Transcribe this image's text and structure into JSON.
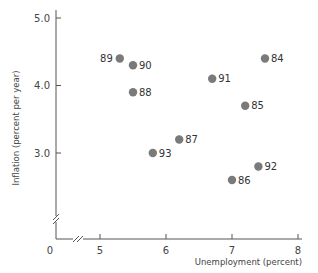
{
  "chart_data": {
    "type": "scatter",
    "title": "",
    "xlabel": "Unemployment (percent)",
    "ylabel": "Inflation (percent per year)",
    "xlim": [
      5,
      8
    ],
    "ylim": [
      2,
      5
    ],
    "x_ticks": [
      "0",
      "5",
      "6",
      "7",
      "8"
    ],
    "y_ticks": [
      "3.0",
      "4.0",
      "5.0"
    ],
    "axis_breaks": true,
    "grid": false,
    "legend": null,
    "marker_color": "#7a7a7a",
    "points": [
      {
        "label": "84",
        "x": 7.5,
        "y": 4.4
      },
      {
        "label": "85",
        "x": 7.2,
        "y": 3.7
      },
      {
        "label": "86",
        "x": 7.0,
        "y": 2.6
      },
      {
        "label": "87",
        "x": 6.2,
        "y": 3.2
      },
      {
        "label": "88",
        "x": 5.5,
        "y": 3.9
      },
      {
        "label": "89",
        "x": 5.3,
        "y": 4.4
      },
      {
        "label": "90",
        "x": 5.5,
        "y": 4.3
      },
      {
        "label": "91",
        "x": 6.7,
        "y": 4.1
      },
      {
        "label": "92",
        "x": 7.4,
        "y": 2.8
      },
      {
        "label": "93",
        "x": 5.8,
        "y": 3.0
      }
    ]
  }
}
